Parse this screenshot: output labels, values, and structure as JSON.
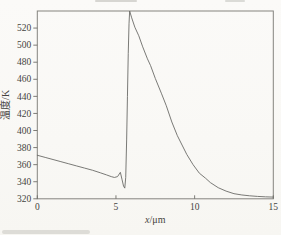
{
  "figure": {
    "background": "#faf9f6",
    "frame_color": "#85847f",
    "line_color": "#6b6b68",
    "tick_color": "#6f6e69",
    "text_color": "#45443e"
  },
  "chart_data": {
    "type": "line",
    "title": "",
    "xlabel": "x/μm",
    "xlabel_var": "x",
    "xlabel_unit": "/μm",
    "ylabel": "温度/K",
    "xlim": [
      0,
      15
    ],
    "ylim": [
      320,
      540
    ],
    "x_ticks": [
      0,
      5,
      10,
      15
    ],
    "y_ticks": [
      320,
      340,
      360,
      380,
      400,
      420,
      440,
      460,
      480,
      500,
      520
    ],
    "grid": false,
    "legend": null,
    "series": [
      {
        "name": "temperature-profile",
        "x": [
          0,
          0.5,
          1,
          1.5,
          2,
          2.5,
          3,
          3.5,
          4,
          4.4,
          4.7,
          4.9,
          5.1,
          5.28,
          5.38,
          5.48,
          5.56,
          5.62,
          5.68,
          5.73,
          5.78,
          5.83,
          5.87,
          6.0,
          6.2,
          6.45,
          6.7,
          7.0,
          7.2,
          7.5,
          7.9,
          8.2,
          8.55,
          8.9,
          9.2,
          9.5,
          9.9,
          10.3,
          10.7,
          11.0,
          11.5,
          12.0,
          12.5,
          13.0,
          13.5,
          14.0,
          14.5,
          15.0
        ],
        "y": [
          371,
          368.5,
          366,
          363.5,
          361,
          358.5,
          356,
          353.5,
          350.5,
          348,
          346,
          345,
          346,
          351,
          343,
          335,
          332.5,
          345,
          390,
          440,
          490,
          525,
          540,
          532,
          521,
          511,
          498,
          484,
          476,
          461,
          443,
          429,
          410,
          394,
          383,
          372,
          360,
          350,
          344,
          339,
          333,
          329,
          326,
          324.5,
          323.5,
          322.8,
          322.3,
          322
        ]
      }
    ]
  }
}
